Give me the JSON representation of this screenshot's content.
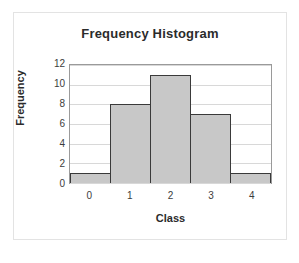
{
  "chart_data": {
    "type": "bar",
    "title": "Frequency Histogram",
    "xlabel": "Class",
    "ylabel": "Frequency",
    "categories": [
      "0",
      "1",
      "2",
      "3",
      "4"
    ],
    "values": [
      1,
      8,
      11,
      7,
      1
    ],
    "yticks": [
      0,
      2,
      4,
      6,
      8,
      10,
      12
    ],
    "ylim": [
      0,
      12
    ],
    "grid": true,
    "legend": false,
    "bar_fill_color": "#c8c8c8",
    "bar_edge_color": "#3a3a3a",
    "gridline_color": "#d8d8d8",
    "axis_color": "#9a9a9a",
    "background_color": "#ffffff"
  }
}
